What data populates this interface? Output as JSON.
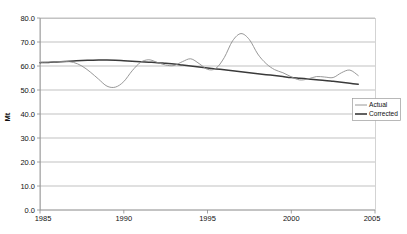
{
  "chart_data": {
    "type": "line",
    "title": "",
    "xlabel": "",
    "ylabel": "Mt",
    "xlim": [
      1985,
      2005
    ],
    "ylim": [
      0.0,
      80.0
    ],
    "ytick_step": 10,
    "grid": true,
    "legend_position": "right-middle",
    "xticks": [
      "1985",
      "1990",
      "1995",
      "2000",
      "2005"
    ],
    "yticks": [
      "0.0",
      "10.0",
      "20.0",
      "30.0",
      "40.0",
      "50.0",
      "60.0",
      "70.0",
      "80.0"
    ],
    "colors": {
      "actual": "#8c8c8c",
      "corrected": "#3a3a3a",
      "gridline": "#a8a8a8",
      "frame": "#c9c9c9",
      "background": "#ffffff"
    },
    "x": [
      1985,
      1985.5,
      1986,
      1986.5,
      1987,
      1987.5,
      1988,
      1988.5,
      1989,
      1989.5,
      1990,
      1990.5,
      1991,
      1991.5,
      1992,
      1992.5,
      1993,
      1993.5,
      1994,
      1994.5,
      1995,
      1995.5,
      1996,
      1996.5,
      1997,
      1997.5,
      1998,
      1998.5,
      1999,
      1999.5,
      2000,
      2000.5,
      2001,
      2001.5,
      2002,
      2002.5,
      2003,
      2003.5,
      2004
    ],
    "series": [
      {
        "name": "Actual",
        "color": "#8c8c8c",
        "width": 0.9,
        "values": [
          61.5,
          61.6,
          61.8,
          61.9,
          61.5,
          60.0,
          57.5,
          54.5,
          51.6,
          51.2,
          53.5,
          58.0,
          61.5,
          62.6,
          61.5,
          60.4,
          60.2,
          61.8,
          63.0,
          61.0,
          58.6,
          59.0,
          63.5,
          70.5,
          73.5,
          71.0,
          65.0,
          61.0,
          58.5,
          57.2,
          55.5,
          54.2,
          54.6,
          55.6,
          55.4,
          55.2,
          57.2,
          58.3,
          56.0
        ]
      },
      {
        "name": "Corrected",
        "color": "#3a3a3a",
        "width": 1.5,
        "values": [
          61.4,
          61.5,
          61.7,
          61.9,
          62.1,
          62.3,
          62.4,
          62.5,
          62.5,
          62.4,
          62.2,
          62.0,
          61.8,
          61.6,
          61.4,
          61.1,
          60.8,
          60.4,
          60.0,
          59.6,
          59.2,
          58.8,
          58.4,
          58.0,
          57.6,
          57.2,
          56.8,
          56.4,
          56.0,
          55.6,
          55.2,
          54.9,
          54.6,
          54.3,
          54.0,
          53.6,
          53.2,
          52.8,
          52.4
        ]
      }
    ],
    "annotations": [
      {
        "label": "peak",
        "x": 1997,
        "y": 73.5,
        "series": "Actual"
      },
      {
        "label": "trough",
        "x": 1989.5,
        "y": 51.2,
        "series": "Actual"
      }
    ]
  },
  "legend": {
    "items": [
      {
        "label": "Actual"
      },
      {
        "label": "Corrected"
      }
    ]
  }
}
